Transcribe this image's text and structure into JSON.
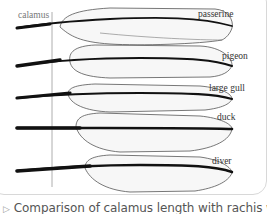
{
  "figure": {
    "axis_label": "calamus",
    "feathers": [
      {
        "label": "passerine"
      },
      {
        "label": "pigeon"
      },
      {
        "label": "large gull"
      },
      {
        "label": "duck"
      },
      {
        "label": "diver"
      }
    ]
  },
  "caption": {
    "icon": "triangle-right-icon",
    "text": "Comparison of calamus length with rachis width in"
  }
}
